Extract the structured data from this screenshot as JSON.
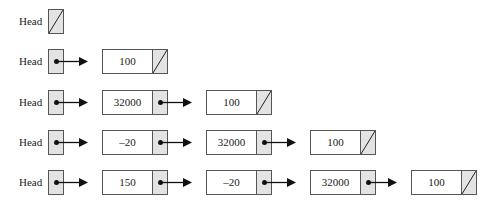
{
  "diagram": {
    "head_label": "Head",
    "null_marker": "diagonal-slash",
    "colors": {
      "pointer_cell": "#e3e3e3",
      "border": "#555555",
      "arrow": "#111111"
    },
    "rows": [
      {
        "label": "Head",
        "head_null": true,
        "nodes": []
      },
      {
        "label": "Head",
        "head_null": false,
        "nodes": [
          "100"
        ]
      },
      {
        "label": "Head",
        "head_null": false,
        "nodes": [
          "32000",
          "100"
        ]
      },
      {
        "label": "Head",
        "head_null": false,
        "nodes": [
          "–20",
          "32000",
          "100"
        ]
      },
      {
        "label": "Head",
        "head_null": false,
        "nodes": [
          "150",
          "–20",
          "32000",
          "100"
        ]
      }
    ]
  }
}
